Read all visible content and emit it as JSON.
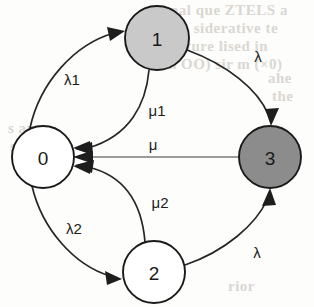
{
  "figure": {
    "type": "markov-state-transition-diagram",
    "background_color": "#fdfdfc"
  },
  "nodes": [
    {
      "id": "0",
      "label": "0",
      "fill": "#ffffff",
      "stroke": "#1a1a1a",
      "cx": 43,
      "cy": 157,
      "r": 31
    },
    {
      "id": "1",
      "label": "1",
      "fill": "#c9c9c9",
      "stroke": "#1a1a1a",
      "cx": 157,
      "cy": 38,
      "r": 32
    },
    {
      "id": "2",
      "label": "2",
      "fill": "#ffffff",
      "stroke": "#1a1a1a",
      "cx": 154,
      "cy": 272,
      "r": 31
    },
    {
      "id": "3",
      "label": "3",
      "fill": "#8c8c8c",
      "stroke": "#1a1a1a",
      "cx": 270,
      "cy": 157,
      "r": 31
    }
  ],
  "edges": [
    {
      "id": "e01",
      "from": "0",
      "to": "1",
      "label": "λ1",
      "label_x": 72,
      "label_y": 79
    },
    {
      "id": "e13",
      "from": "1",
      "to": "3",
      "label": "λ",
      "label_x": 258,
      "label_y": 56
    },
    {
      "id": "e10",
      "from": "1",
      "to": "0",
      "label": "μ1",
      "label_x": 157,
      "label_y": 110
    },
    {
      "id": "e30",
      "from": "3",
      "to": "0",
      "label": "μ",
      "label_x": 153,
      "label_y": 144
    },
    {
      "id": "e20",
      "from": "2",
      "to": "0",
      "label": "μ2",
      "label_x": 160,
      "label_y": 202
    },
    {
      "id": "e02",
      "from": "0",
      "to": "2",
      "label": "λ2",
      "label_x": 74,
      "label_y": 228
    },
    {
      "id": "e23",
      "from": "2",
      "to": "3",
      "label": "λ",
      "label_x": 257,
      "label_y": 252
    }
  ],
  "background_text": [
    {
      "text": "nal  que  ZTELS  a",
      "x": 170,
      "y": 8
    },
    {
      "text": "in  siderative  te",
      "x": 176,
      "y": 26
    },
    {
      "text": "ture  lised  in",
      "x": 186,
      "y": 44
    },
    {
      "text": "n OO) sir m (×0)",
      "x": 168,
      "y": 62
    },
    {
      "text": "ahe",
      "x": 268,
      "y": 76
    },
    {
      "text": "the",
      "x": 272,
      "y": 94
    },
    {
      "text": "s are",
      "x": 12,
      "y": 126
    },
    {
      "text": "ses",
      "x": 14,
      "y": 144
    },
    {
      "text": "rior",
      "x": 230,
      "y": 284
    }
  ]
}
